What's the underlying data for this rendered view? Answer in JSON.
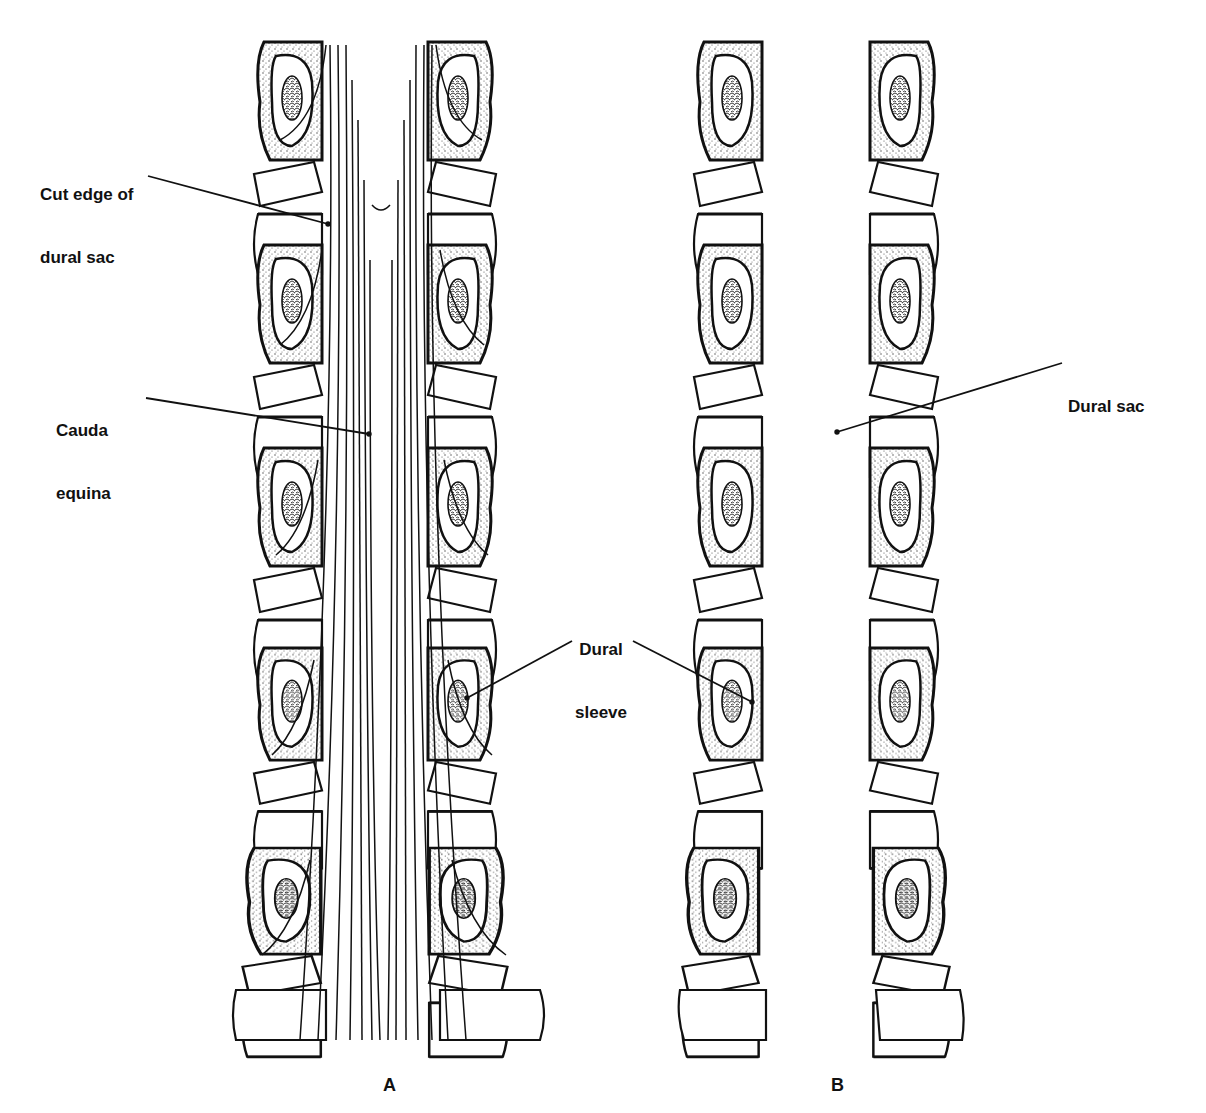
{
  "figure": {
    "panels": [
      {
        "id": "A",
        "letter": "A",
        "letter_pos": [
          383,
          1075
        ],
        "center_x": 365
      },
      {
        "id": "B",
        "letter": "B",
        "letter_pos": [
          831,
          1075
        ],
        "center_x": 830
      }
    ],
    "labels": [
      {
        "id": "cut-edge",
        "line1": "Cut edge of",
        "line2": "dural sac",
        "pos": [
          40,
          142
        ],
        "leader": [
          [
            148,
            176
          ],
          [
            328,
            224
          ]
        ]
      },
      {
        "id": "cauda-equina",
        "line1": "Cauda",
        "line2": "equina",
        "pos": [
          56,
          378
        ],
        "leader": [
          [
            146,
            398
          ],
          [
            369,
            434
          ]
        ]
      },
      {
        "id": "dural-sac",
        "line1": "Dural sac",
        "line2": "",
        "pos": [
          1068,
          354
        ],
        "leader": [
          [
            1062,
            363
          ],
          [
            837,
            432
          ]
        ]
      },
      {
        "id": "dural-sleeve",
        "line1": "Dural",
        "line2": "sleeve",
        "pos": [
          575,
          597
        ],
        "leader_left": [
          [
            572,
            641
          ],
          [
            467,
            698
          ]
        ],
        "leader_right": [
          [
            633,
            641
          ],
          [
            752,
            702
          ]
        ]
      }
    ],
    "colors": {
      "ink": "#111111",
      "stipple": "#bdbdbd",
      "paper": "#ffffff"
    }
  }
}
